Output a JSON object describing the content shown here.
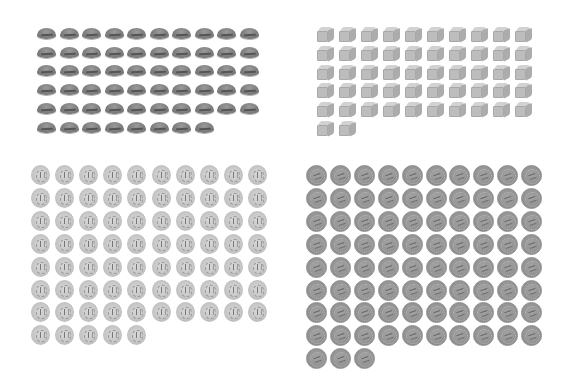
{
  "page": {
    "background": "#ffffff"
  },
  "groups": [
    {
      "id": "buns",
      "object": "bread-roll",
      "count": 58,
      "columns": 10,
      "origin": [
        37,
        28
      ],
      "spacing": [
        22.5,
        18.7
      ],
      "class": "bun",
      "color": "#7e7e7e"
    },
    {
      "id": "blocks",
      "object": "cube-block",
      "count": 52,
      "columns": 10,
      "origin": [
        317,
        27
      ],
      "spacing": [
        22.0,
        18.8
      ],
      "class": "block",
      "color": "#bdbdbd"
    },
    {
      "id": "light-coins",
      "object": "light-coin",
      "count": 75,
      "columns": 10,
      "origin": [
        31,
        165
      ],
      "spacing": [
        24.1,
        22.9
      ],
      "class": "coin-light",
      "color": "#c6c6c6"
    },
    {
      "id": "dark-coins",
      "object": "dark-coin",
      "count": 83,
      "columns": 10,
      "origin": [
        306,
        165
      ],
      "spacing": [
        23.9,
        22.9
      ],
      "class": "coin-dark",
      "color": "#939393"
    }
  ]
}
